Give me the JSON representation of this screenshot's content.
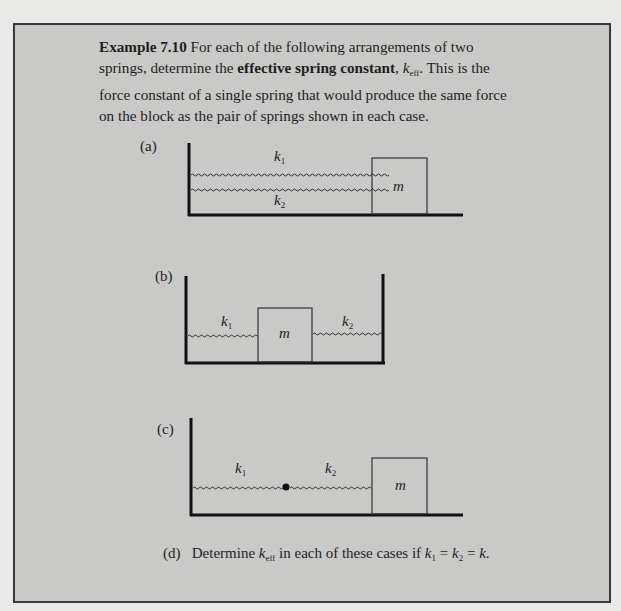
{
  "example": {
    "label": "Example 7.10",
    "text1": " For each of the following arrangements of two springs, determine the ",
    "bold_term": "effective spring constant",
    "text2": ", ",
    "keff_k": "k",
    "keff_sub": "eff",
    "text3": ". This is the force constant of a single spring that would produce the same force on the block as the pair of springs shown in each case."
  },
  "parts": {
    "a": {
      "label": "(a)",
      "k1": "k",
      "k1_sub": "1",
      "k2": "k",
      "k2_sub": "2",
      "mass": "m"
    },
    "b": {
      "label": "(b)",
      "k1": "k",
      "k1_sub": "1",
      "k2": "k",
      "k2_sub": "2",
      "mass": "m"
    },
    "c": {
      "label": "(c)",
      "k1": "k",
      "k1_sub": "1",
      "k2": "k",
      "k2_sub": "2",
      "mass": "m"
    },
    "d": {
      "label": "(d)",
      "text1": "Determine ",
      "k": "k",
      "k_sub": "eff",
      "text2": " in each of these cases if ",
      "eq": "k",
      "eq_sub1": "1",
      "eq_mid": " = ",
      "eq2": "k",
      "eq_sub2": "2",
      "eq_end": " = ",
      "eq3": "k",
      "period": "."
    }
  }
}
